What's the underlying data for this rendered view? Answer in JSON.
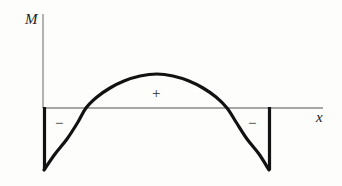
{
  "figure": {
    "kind": "bending-moment-diagram",
    "title": "",
    "background_color": "#fdfdfc",
    "axes": {
      "vertical_axis_label": "M",
      "horizontal_axis_label": "x",
      "axis_color": "#8a8a8a",
      "axis_line_width": 1.3,
      "origin_x": 43,
      "baseline_y": 108,
      "vertical_axis_top_y": 14,
      "horizontal_axis_right_x": 323
    },
    "annotations": [
      {
        "name": "positive-region-sign",
        "text": "+",
        "x": 155,
        "y": 93
      },
      {
        "name": "negative-region-sign-left",
        "text": "−",
        "x": 58,
        "y": 122
      },
      {
        "name": "negative-region-sign-right",
        "text": "−",
        "x": 251,
        "y": 122
      }
    ],
    "curve": {
      "color": "#121212",
      "line_width": 3.2,
      "description": "Parabolic bending moment curve: starts at left support minimum, rises through zero crossing to a central positive maximum, falls through the right zero crossing to the right support minimum."
    },
    "support_lines": {
      "color": "#121212",
      "line_width": 3.2,
      "left_x": 44,
      "right_x": 269,
      "top_y": 108,
      "bottom_y": 170
    }
  },
  "chart_data": {
    "type": "line",
    "title": "",
    "xlabel": "x",
    "ylabel": "M",
    "grid": false,
    "legend": null,
    "xlim": [
      43,
      323
    ],
    "ylim": [
      -62,
      34
    ],
    "zero_line_y": 108,
    "zero_crossings_x": [
      86,
      227
    ],
    "series": [
      {
        "name": "bending-moment",
        "color": "#121212",
        "points": [
          {
            "x": 44,
            "y": 170
          },
          {
            "x": 55,
            "y": 154
          },
          {
            "x": 67,
            "y": 139
          },
          {
            "x": 78,
            "y": 122
          },
          {
            "x": 86,
            "y": 108
          },
          {
            "x": 97,
            "y": 97
          },
          {
            "x": 110,
            "y": 88
          },
          {
            "x": 124,
            "y": 81
          },
          {
            "x": 140,
            "y": 76
          },
          {
            "x": 157,
            "y": 74
          },
          {
            "x": 173,
            "y": 76
          },
          {
            "x": 189,
            "y": 81
          },
          {
            "x": 203,
            "y": 88
          },
          {
            "x": 216,
            "y": 97
          },
          {
            "x": 227,
            "y": 108
          },
          {
            "x": 236,
            "y": 122
          },
          {
            "x": 247,
            "y": 139
          },
          {
            "x": 259,
            "y": 154
          },
          {
            "x": 269,
            "y": 170
          }
        ]
      }
    ],
    "vertical_drops": [
      {
        "name": "left-support-drop",
        "x": 44,
        "y_from": 108,
        "y_to": 170
      },
      {
        "name": "right-support-drop",
        "x": 269,
        "y_from": 108,
        "y_to": 170
      }
    ],
    "annotations": [
      {
        "text": "+",
        "x": 155,
        "y": 93,
        "region": "positive-hogging-midspan"
      },
      {
        "text": "−",
        "x": 58,
        "y": 122,
        "region": "negative-left-support"
      },
      {
        "text": "−",
        "x": 251,
        "y": 122,
        "region": "negative-right-support"
      }
    ]
  }
}
